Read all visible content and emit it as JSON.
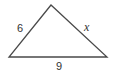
{
  "diagram": {
    "type": "triangle",
    "stroke_color": "#4a4a4a",
    "vertices": {
      "apex": [
        51,
        5
      ],
      "bottom_left": [
        9,
        57
      ],
      "bottom_right": [
        107,
        57
      ]
    },
    "sides": [
      {
        "id": "left",
        "label": "6"
      },
      {
        "id": "right",
        "label": "x"
      },
      {
        "id": "base",
        "label": "9"
      }
    ]
  }
}
